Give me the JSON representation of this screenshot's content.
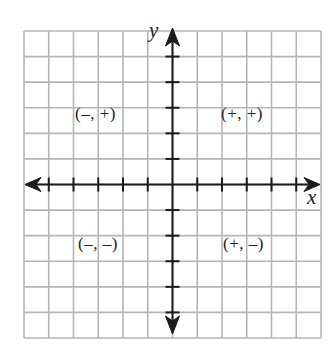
{
  "diagram": {
    "type": "coordinate-plane",
    "grid": {
      "columns": 12,
      "rows": 12,
      "line_color": "#b5b5b5",
      "background": "#ffffff"
    },
    "axes": {
      "color": "#1a1a1a",
      "x_label": "x",
      "y_label": "y",
      "x_ticks": [
        -5,
        -4,
        -3,
        -2,
        -1,
        1,
        2,
        3,
        4,
        5
      ],
      "y_ticks": [
        -5,
        -4,
        -3,
        -2,
        -1,
        1,
        2,
        3,
        4,
        5
      ]
    },
    "quadrants": {
      "q1": "(+, +)",
      "q2": "(–, +)",
      "q3": "(–, –)",
      "q4": "(+, –)"
    }
  }
}
